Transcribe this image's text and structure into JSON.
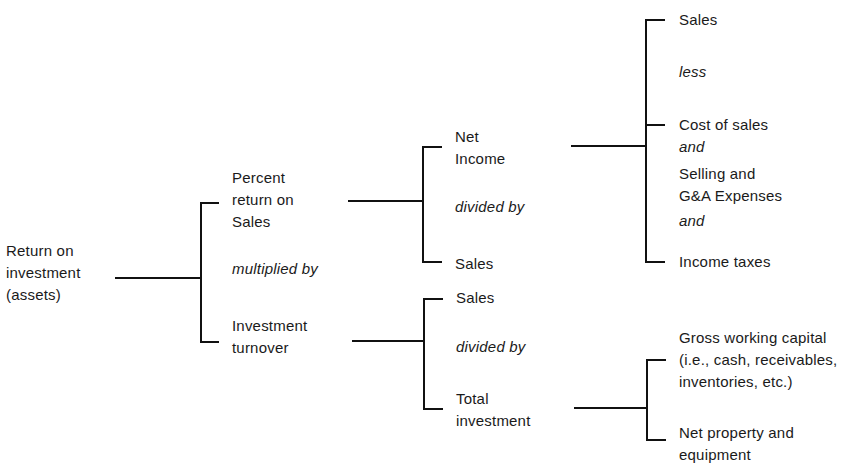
{
  "diagram": {
    "root": {
      "lines": [
        "Return on",
        "investment",
        "(assets)"
      ]
    },
    "level1": {
      "top": {
        "lines": [
          "Percent",
          "return on",
          "Sales"
        ]
      },
      "operator": "multiplied by",
      "bottom": {
        "lines": [
          "Investment",
          "turnover"
        ]
      }
    },
    "percent_return_branch": {
      "top": {
        "lines": [
          "Net",
          "Income"
        ]
      },
      "operator": "divided by",
      "bottom": {
        "lines": [
          "Sales"
        ]
      }
    },
    "net_income_branch": {
      "item1": "Sales",
      "op1": "less",
      "item2": "Cost of sales",
      "op2": "and",
      "item3": [
        "Selling and",
        "G&A Expenses"
      ],
      "op3": "and",
      "item4": "Income taxes"
    },
    "turnover_branch": {
      "top": {
        "lines": [
          "Sales"
        ]
      },
      "operator": "divided by",
      "bottom": {
        "lines": [
          "Total",
          "investment"
        ]
      }
    },
    "total_investment_branch": {
      "item1": [
        "Gross working capital",
        "(i.e., cash, receivables,",
        "inventories, etc.)"
      ],
      "item2": [
        "Net property and",
        "equipment"
      ]
    }
  }
}
